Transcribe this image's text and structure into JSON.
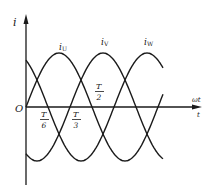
{
  "diagram": {
    "axes": {
      "y_label": "i",
      "x_label_top": "ωt",
      "x_label_bottom": "t",
      "origin_label": "O"
    },
    "curves": [
      {
        "name": "iU",
        "label_main": "i",
        "label_sub": "U",
        "phase_deg": 0
      },
      {
        "name": "iV",
        "label_main": "i",
        "label_sub": "V",
        "phase_deg": -120
      },
      {
        "name": "iW",
        "label_main": "i",
        "label_sub": "W",
        "phase_deg": 120
      }
    ],
    "ticks": [
      {
        "id": "t6",
        "num": "T",
        "den": "6"
      },
      {
        "id": "t3",
        "num": "T",
        "den": "3"
      },
      {
        "id": "t2",
        "num": "T",
        "den": "2"
      }
    ],
    "colors": {
      "stroke": "#1a1a1a",
      "background": "#ffffff"
    }
  }
}
